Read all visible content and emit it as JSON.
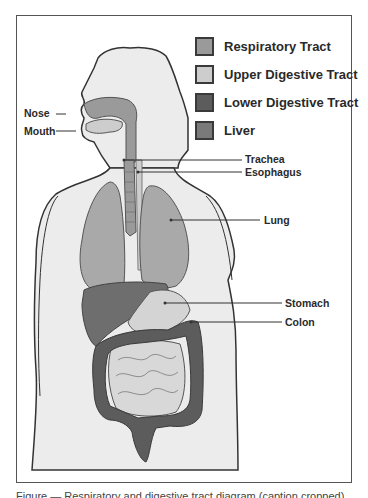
{
  "figure": {
    "legend": [
      {
        "label": "Respiratory Tract",
        "color": "#9a9a9a"
      },
      {
        "label": "Upper Digestive Tract",
        "color": "#cdcdcd"
      },
      {
        "label": "Lower Digestive Tract",
        "color": "#5c5c5c"
      },
      {
        "label": "Liver",
        "color": "#7a7a7a"
      }
    ],
    "labels": {
      "nose": "Nose",
      "mouth": "Mouth",
      "trachea": "Trachea",
      "esophagus": "Esophagus",
      "lung": "Lung",
      "stomach": "Stomach",
      "colon": "Colon"
    },
    "colors": {
      "body_fill": "#ececec",
      "outline": "#333333",
      "frame": "#555555"
    },
    "caption": "Figure — Respiratory and digestive tract diagram (caption cropped)"
  }
}
